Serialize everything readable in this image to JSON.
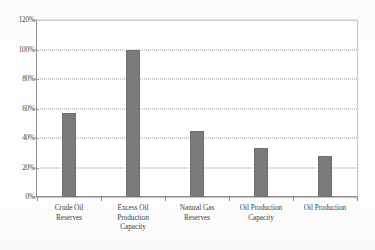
{
  "chart_data": {
    "type": "bar",
    "title": "",
    "subtitle": "",
    "xlabel": "",
    "ylabel": "",
    "categories": [
      "Crude Oil Reserves",
      "Excess Oil Production Capacity",
      "Natural Gas Reserves",
      "Oil Production Capacity",
      "Oil Production"
    ],
    "category_lines": [
      [
        "Crude Oil",
        "Reserves"
      ],
      [
        "Excess Oil",
        "Production",
        "Capacity"
      ],
      [
        "Natural Gas",
        "Reserves"
      ],
      [
        "Oil Production",
        "Capacity"
      ],
      [
        "Oil Production"
      ]
    ],
    "values": [
      57,
      100,
      45,
      33,
      28
    ],
    "value_labels": [
      "57%",
      "100%",
      "45%",
      "33%",
      "28%"
    ],
    "ylim": [
      0,
      120
    ],
    "ytick_step": 20,
    "ytick_labels": [
      "0%",
      "20%",
      "40%",
      "60%",
      "80%",
      "100%",
      "120%"
    ],
    "ytick_values": [
      0,
      20,
      40,
      60,
      80,
      100,
      120
    ],
    "grid": true,
    "grid_style": "dotted",
    "legend": "none",
    "series": [
      {
        "name": "Share",
        "values": [
          57,
          100,
          45,
          33,
          28
        ]
      }
    ]
  },
  "style": {
    "bar_color": "#7b7b7b",
    "bar_border_color": "#6f6f6f",
    "grid_color": "#9a9a9a",
    "axis_color": "#8d8d8d",
    "plot_border_color": "#c8c8c8",
    "text_color": "#3f3f3f",
    "background": "#fdfdfd"
  }
}
